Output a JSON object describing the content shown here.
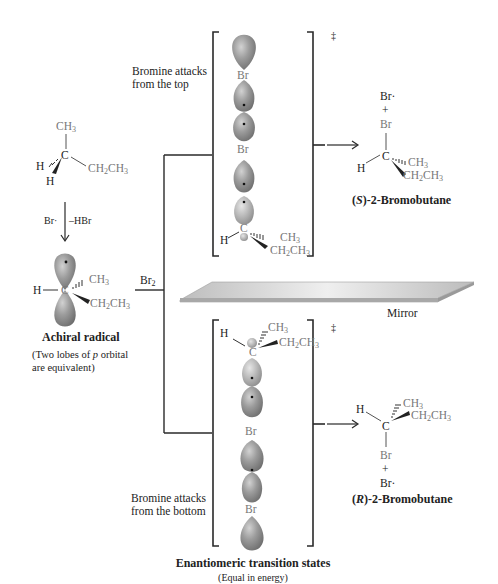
{
  "labels": {
    "attack_top": [
      "Bromine attacks",
      "from the top"
    ],
    "attack_bottom": [
      "Bromine attacks",
      "from the bottom"
    ],
    "br2": "Br",
    "br2_sub": "2",
    "reagent_br": "Br·",
    "reagent_hbr": "–HBr",
    "achiral_title": "Achiral radical",
    "achiral_note": [
      "(Two lobes of ",
      "p",
      " orbital",
      "are equivalent)"
    ],
    "mirror": "Mirror",
    "double_dagger": "‡",
    "ts_title": "Enantiomeric transition states",
    "ts_note": "(Equal in energy)",
    "product_s_config": "S",
    "product_s_name": "-2-Bromobutane",
    "product_r_config": "R",
    "product_r_name": "-2-Bromobutane"
  },
  "atoms": {
    "CH3": "CH",
    "CH2CH3_a": "CH",
    "CH2CH3_b": "CH",
    "sub3": "3",
    "sub2": "2",
    "C": "C",
    "H": "H",
    "Br": "Br",
    "Br_radical": "Br·",
    "plus": "+"
  },
  "colors": {
    "lobe_dark": "#8a8a8a",
    "lobe_mid": "#a6a6a6",
    "lobe_light": "#d0d0d0",
    "line": "#2a2a2a",
    "mirror_top": "#dcdcdc",
    "mirror_edge": "#9e9e9e"
  }
}
